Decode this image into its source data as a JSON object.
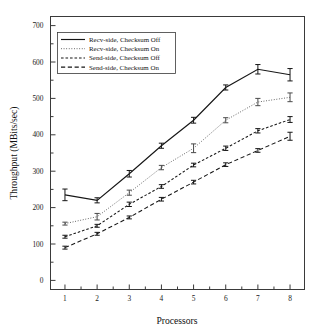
{
  "chart_data": {
    "type": "line",
    "title": "",
    "xlabel": "Processors",
    "ylabel": "Throughput (MBits/sec)",
    "x": [
      1,
      2,
      3,
      4,
      5,
      6,
      7,
      8
    ],
    "xlim": [
      0.55,
      8.45
    ],
    "ylim": [
      -25,
      725
    ],
    "xticks": [
      1,
      2,
      3,
      4,
      5,
      6,
      7,
      8
    ],
    "yticks": [
      0,
      100,
      200,
      300,
      400,
      500,
      600,
      700
    ],
    "xtick_labels": [
      "1",
      "2",
      "3",
      "4",
      "5",
      "6",
      "7",
      "8"
    ],
    "ytick_labels": [
      "0",
      "100",
      "200",
      "300",
      "400",
      "500",
      "600",
      "700"
    ],
    "minor_xticks": true,
    "minor_yticks": true,
    "grid": false,
    "legend_position": "upper-left",
    "error_bars": "standard-deviation",
    "series": [
      {
        "name": "Recv-side, Checksum Off",
        "style": "solid",
        "color": "#161616",
        "values": [
          235,
          220,
          293,
          370,
          440,
          530,
          580,
          565
        ],
        "errors": [
          16,
          7,
          9,
          7,
          8,
          7,
          13,
          17
        ]
      },
      {
        "name": "Recv-side, Checksum On",
        "style": "dotted",
        "color": "#5b5b5b",
        "values": [
          156,
          175,
          241,
          310,
          363,
          440,
          490,
          503
        ],
        "errors": [
          4,
          9,
          7,
          6,
          12,
          7,
          10,
          12
        ]
      },
      {
        "name": "Send-side, Checksum Off",
        "style": "dashed",
        "color": "#161616",
        "values": [
          120,
          150,
          209,
          258,
          317,
          363,
          411,
          442
        ],
        "errors": [
          4,
          4,
          6,
          5,
          5,
          6,
          6,
          8
        ]
      },
      {
        "name": "Send-side, Checksum On",
        "style": "long-dash",
        "color": "#161616",
        "values": [
          90,
          128,
          173,
          223,
          270,
          318,
          357,
          396
        ],
        "errors": [
          4,
          4,
          4,
          5,
          5,
          5,
          5,
          11
        ]
      }
    ]
  },
  "figure": {
    "axis_label_x": "Processors",
    "axis_label_y": "Throughput (MBits/sec)"
  },
  "legend": {
    "items": [
      {
        "label": "Recv-side, Checksum Off",
        "style": "solid"
      },
      {
        "label": "Recv-side, Checksum On",
        "style": "dotted"
      },
      {
        "label": "Send-side, Checksum Off",
        "style": "dashed"
      },
      {
        "label": "Send-side, Checksum On",
        "style": "long-dash"
      }
    ]
  }
}
